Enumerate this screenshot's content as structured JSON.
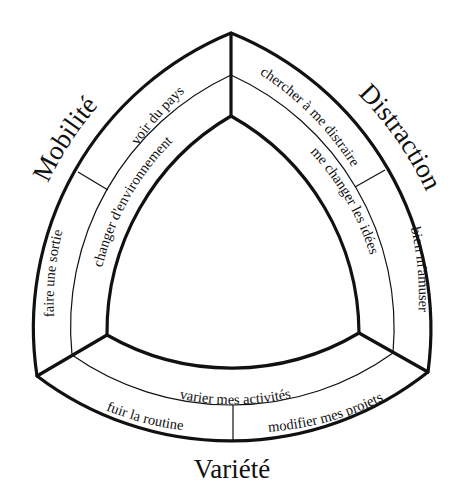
{
  "diagram": {
    "categories": {
      "mobilite": "Mobilité",
      "distraction": "Distraction",
      "variete": "Variété"
    },
    "outer_ring": {
      "mobilite": [
        "voir du pays",
        "faire une sortie"
      ],
      "distraction": [
        "chercher à me distraire",
        "bien m'amuser"
      ],
      "variete": [
        "fuir la routine",
        "modifier mes projets"
      ]
    },
    "inner_ring": {
      "mobilite": "changer d'environnement",
      "distraction": "me changer les idées",
      "variete": "varier mes activités"
    },
    "colors": {
      "stroke": "#111111",
      "background": "#ffffff"
    }
  }
}
